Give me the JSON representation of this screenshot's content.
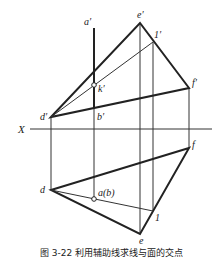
{
  "figure": {
    "caption": "图 3-22  利用辅助线求线与面的交点",
    "axis_label": "X",
    "labels": {
      "a_prime": "a′",
      "e_prime": "e′",
      "one_prime": "1′",
      "k_prime": "k′",
      "f_prime": "f′",
      "d_prime": "d′",
      "b_prime": "b′",
      "f": "f",
      "d": "d",
      "a_b": "a(b)",
      "one": "1",
      "e": "e"
    },
    "colors": {
      "line": "#222222",
      "background": "#ffffff"
    }
  }
}
